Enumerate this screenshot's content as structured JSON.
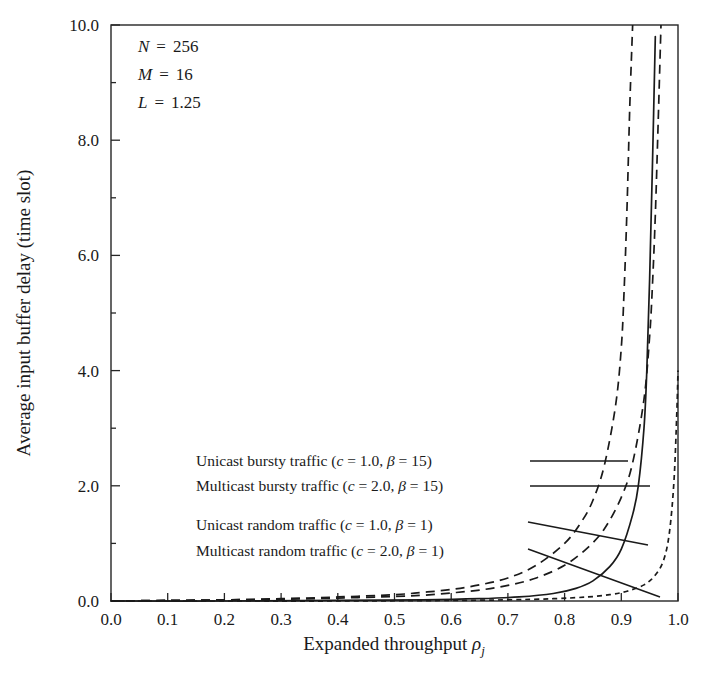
{
  "chart_data": {
    "type": "line",
    "title": "",
    "xlabel": "Expanded throughput ρⱼ",
    "ylabel": "Average input buffer delay (time slot)",
    "xlim": [
      0.0,
      1.0
    ],
    "ylim": [
      0.0,
      10.0
    ],
    "xticks": [
      "0.0",
      "0.1",
      "0.2",
      "0.3",
      "0.4",
      "0.5",
      "0.6",
      "0.7",
      "0.8",
      "0.9",
      "1.0"
    ],
    "yticks": [
      "0.0",
      "2.0",
      "4.0",
      "6.0",
      "8.0",
      "10.0"
    ],
    "xtick_values": [
      0.0,
      0.1,
      0.2,
      0.3,
      0.4,
      0.5,
      0.6,
      0.7,
      0.8,
      0.9,
      1.0
    ],
    "ytick_values": [
      0.0,
      2.0,
      4.0,
      6.0,
      8.0,
      10.0
    ],
    "grid": false,
    "legend_position": "inside-left-middle",
    "series": [
      {
        "name": "Unicast bursty traffic (c = 1.0, β = 15)",
        "style": "dashed",
        "label_plain": "Unicast bursty traffic",
        "c": "1.0",
        "beta": "15",
        "x": [
          0.0,
          0.1,
          0.2,
          0.3,
          0.4,
          0.5,
          0.55,
          0.6,
          0.65,
          0.7,
          0.75,
          0.8,
          0.83,
          0.85,
          0.87,
          0.89,
          0.9,
          0.905,
          0.91,
          0.915,
          0.92
        ],
        "y": [
          0.0,
          0.01,
          0.02,
          0.04,
          0.07,
          0.11,
          0.15,
          0.2,
          0.28,
          0.4,
          0.62,
          1.0,
          1.38,
          1.75,
          2.35,
          3.4,
          4.4,
          5.4,
          6.8,
          8.6,
          10.0
        ]
      },
      {
        "name": "Multicast bursty traffic (c = 2.0, β = 15)",
        "style": "dashed",
        "label_plain": "Multicast bursty traffic",
        "c": "2.0",
        "beta": "15",
        "x": [
          0.0,
          0.1,
          0.2,
          0.3,
          0.4,
          0.5,
          0.55,
          0.6,
          0.65,
          0.7,
          0.75,
          0.8,
          0.84,
          0.87,
          0.9,
          0.92,
          0.94,
          0.95,
          0.955,
          0.96,
          0.965,
          0.97
        ],
        "y": [
          0.0,
          0.01,
          0.02,
          0.03,
          0.05,
          0.08,
          0.1,
          0.14,
          0.19,
          0.27,
          0.4,
          0.62,
          0.92,
          1.25,
          1.8,
          2.4,
          3.5,
          4.6,
          5.5,
          6.7,
          8.3,
          10.0
        ]
      },
      {
        "name": "Unicast random traffic (c = 1.0, β = 1)",
        "style": "solid",
        "label_plain": "Unicast random traffic",
        "c": "1.0",
        "beta": "1",
        "x": [
          0.0,
          0.2,
          0.4,
          0.55,
          0.65,
          0.72,
          0.78,
          0.82,
          0.85,
          0.88,
          0.9,
          0.92,
          0.93,
          0.94,
          0.945,
          0.95,
          0.955,
          0.96
        ],
        "y": [
          0.0,
          0.0,
          0.01,
          0.02,
          0.04,
          0.07,
          0.13,
          0.22,
          0.35,
          0.6,
          0.9,
          1.5,
          2.0,
          3.0,
          4.0,
          5.6,
          7.6,
          9.8
        ]
      },
      {
        "name": "Multicast random traffic (c = 2.0, β = 1)",
        "style": "dotted",
        "label_plain": "Multicast random traffic",
        "c": "2.0",
        "beta": "1",
        "x": [
          0.0,
          0.2,
          0.4,
          0.6,
          0.7,
          0.78,
          0.84,
          0.88,
          0.91,
          0.94,
          0.96,
          0.975,
          0.985,
          0.993,
          0.998,
          1.0
        ],
        "y": [
          0.0,
          0.0,
          0.0,
          0.01,
          0.02,
          0.04,
          0.07,
          0.11,
          0.17,
          0.28,
          0.45,
          0.72,
          1.2,
          2.1,
          3.3,
          4.0
        ]
      }
    ],
    "annotations": [
      {
        "symbol": "N",
        "eq": "=",
        "value": "256"
      },
      {
        "symbol": "M",
        "eq": "=",
        "value": "16"
      },
      {
        "symbol": "L",
        "eq": "=",
        "value": "1.25"
      }
    ]
  },
  "legend_lines": [
    {
      "prefix": "Unicast bursty traffic (",
      "c_sym": "c",
      "c_eq": " = 1.0, ",
      "b_sym": "β",
      "b_eq": " = 15)"
    },
    {
      "prefix": "Multicast bursty traffic (",
      "c_sym": "c",
      "c_eq": " = 2.0, ",
      "b_sym": "β",
      "b_eq": " = 15)"
    },
    {
      "prefix": "Unicast random traffic (",
      "c_sym": "c",
      "c_eq": " = 1.0, ",
      "b_sym": "β",
      "b_eq": " = 1)"
    },
    {
      "prefix": "Multicast random traffic (",
      "c_sym": "c",
      "c_eq": " = 2.0, ",
      "b_sym": "β",
      "b_eq": " = 1)"
    }
  ],
  "axis": {
    "xlabel_main": "Expanded throughput ",
    "xlabel_rho": "ρ",
    "xlabel_sub": "j",
    "ylabel": "Average input buffer delay (time slot)"
  },
  "colors": {
    "ink": "#1a1a1a",
    "frame": "#262626",
    "background": "#ffffff"
  }
}
